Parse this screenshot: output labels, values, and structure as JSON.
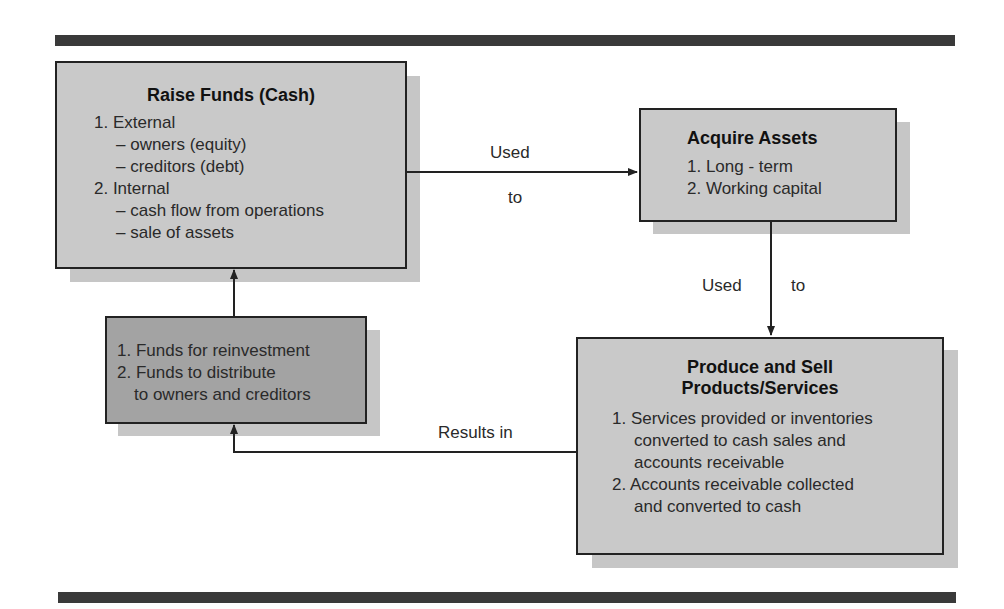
{
  "diagram": {
    "type": "flowchart",
    "boxes": {
      "raise_funds": {
        "title": "Raise Funds (Cash)",
        "items": [
          {
            "level": 1,
            "text": "1. External"
          },
          {
            "level": 2,
            "text": "– owners (equity)"
          },
          {
            "level": 2,
            "text": "– creditors (debt)"
          },
          {
            "level": 1,
            "text": "2. Internal"
          },
          {
            "level": 2,
            "text": "– cash flow from operations"
          },
          {
            "level": 2,
            "text": "– sale of assets"
          }
        ]
      },
      "acquire_assets": {
        "title": "Acquire Assets",
        "items": [
          {
            "level": 1,
            "text": "1. Long - term"
          },
          {
            "level": 1,
            "text": "2. Working capital"
          }
        ]
      },
      "produce_sell": {
        "title_line1": "Produce and Sell",
        "title_line2": "Products/Services",
        "items": [
          {
            "level": 1,
            "text": "1. Services provided or inventories"
          },
          {
            "level": 3,
            "text": "converted to cash sales and"
          },
          {
            "level": 3,
            "text": "accounts receivable"
          },
          {
            "level": 1,
            "text": "2. Accounts receivable collected"
          },
          {
            "level": 3,
            "text": "and converted to cash"
          }
        ]
      },
      "results": {
        "items": [
          {
            "level": 1,
            "text": "1. Funds for reinvestment"
          },
          {
            "level": 1,
            "text": "2. Funds to distribute"
          },
          {
            "level": 3,
            "text": "to owners and creditors"
          }
        ]
      }
    },
    "edges": [
      {
        "from": "raise_funds",
        "to": "acquire_assets",
        "label_top": "Used",
        "label_bottom": "to"
      },
      {
        "from": "acquire_assets",
        "to": "produce_sell",
        "label_left": "Used",
        "label_right": "to"
      },
      {
        "from": "produce_sell",
        "to": "results",
        "label": "Results in"
      },
      {
        "from": "results",
        "to": "raise_funds",
        "label": ""
      }
    ],
    "colors": {
      "box_fill": "#c9c9c9",
      "results_fill": "#a3a3a3",
      "shadow": "#c6c6c6",
      "border": "#222222",
      "bar": "#3a3a3a"
    }
  }
}
